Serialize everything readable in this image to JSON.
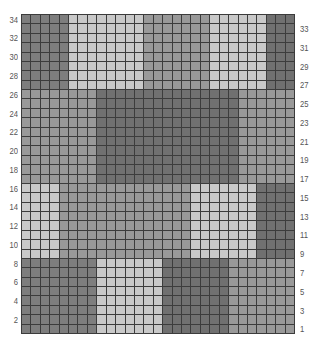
{
  "grid": {
    "rows": 34,
    "cols": 29,
    "left_labels": [
      "34",
      "32",
      "30",
      "28",
      "26",
      "24",
      "22",
      "20",
      "18",
      "16",
      "14",
      "12",
      "10",
      "8",
      "6",
      "4",
      "2"
    ],
    "right_labels": [
      "33",
      "31",
      "29",
      "27",
      "25",
      "23",
      "21",
      "19",
      "17",
      "15",
      "13",
      "11",
      "9",
      "7",
      "5",
      "3",
      "1"
    ],
    "colors": {
      "dark": "#707070",
      "medium": "#999999",
      "light": "#c9c9c9",
      "darkmid": "#7e7e7e",
      "gridline": "#3c3c3c"
    },
    "bands": [
      {
        "rows_from": 27,
        "rows_to": 34,
        "segments": [
          {
            "cols": [
              0,
              4
            ],
            "tone": "darkmid"
          },
          {
            "cols": [
              5,
              12
            ],
            "tone": "light"
          },
          {
            "cols": [
              13,
              19
            ],
            "tone": "medium"
          },
          {
            "cols": [
              20,
              25
            ],
            "tone": "light"
          },
          {
            "cols": [
              26,
              28
            ],
            "tone": "dark"
          }
        ]
      },
      {
        "rows_from": 17,
        "rows_to": 26,
        "segments": [
          {
            "cols": [
              0,
              7
            ],
            "tone": "medium"
          },
          {
            "cols": [
              8,
              22
            ],
            "tone": "dark"
          },
          {
            "cols": [
              23,
              28
            ],
            "tone": "medium"
          }
        ]
      },
      {
        "rows_from": 9,
        "rows_to": 16,
        "segments": [
          {
            "cols": [
              0,
              3
            ],
            "tone": "light"
          },
          {
            "cols": [
              4,
              17
            ],
            "tone": "medium"
          },
          {
            "cols": [
              18,
              24
            ],
            "tone": "light"
          },
          {
            "cols": [
              25,
              28
            ],
            "tone": "dark"
          }
        ]
      },
      {
        "rows_from": 1,
        "rows_to": 8,
        "segments": [
          {
            "cols": [
              0,
              7
            ],
            "tone": "darkmid"
          },
          {
            "cols": [
              8,
              14
            ],
            "tone": "light"
          },
          {
            "cols": [
              15,
              21
            ],
            "tone": "dark"
          },
          {
            "cols": [
              22,
              28
            ],
            "tone": "medium"
          }
        ]
      }
    ]
  }
}
